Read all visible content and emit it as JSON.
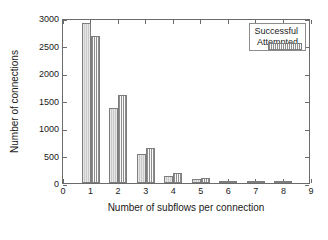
{
  "chart_data": {
    "type": "bar",
    "title": "",
    "xlabel": "Number of subflows per connection",
    "ylabel": "Number of connections",
    "categories": [
      "1",
      "2",
      "3",
      "4",
      "5",
      "6",
      "7",
      "8"
    ],
    "xlim": [
      0,
      9
    ],
    "ylim": [
      0,
      3000
    ],
    "xticks": [
      "0",
      "1",
      "2",
      "3",
      "4",
      "5",
      "6",
      "7",
      "8",
      "9"
    ],
    "yticks": [
      "0",
      "500",
      "1000",
      "1500",
      "2000",
      "2500",
      "3000"
    ],
    "grid": false,
    "legend_position": "upper right",
    "series": [
      {
        "name": "Successful",
        "color": "#c9c9c9",
        "values": [
          2910,
          1370,
          520,
          130,
          65,
          15,
          8,
          5
        ]
      },
      {
        "name": "Attempted",
        "color": "#cfcfcf",
        "values": [
          2680,
          1600,
          640,
          180,
          95,
          25,
          20,
          10
        ]
      }
    ]
  }
}
